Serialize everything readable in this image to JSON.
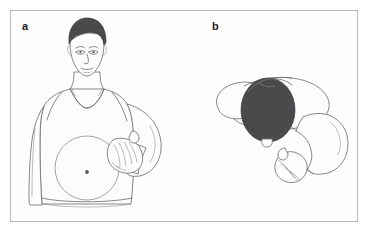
{
  "figure": {
    "kind": "medical-illustration",
    "border_color": "#b9b9bb",
    "background_color": "#ffffff",
    "line_color": "#6f7174",
    "hair_color": "#4a4a4c",
    "skin_fill": "#fdfdfd",
    "panels": [
      {
        "id": "a",
        "label": "a",
        "view": "front-standing",
        "description": "Person standing facing forward wearing a v-neck sleeveless top, with a circular stoma site marked on the abdomen and one hand held beside it",
        "elements": [
          "head-with-short-dark-hair",
          "face",
          "v-neck-sleeveless-shirt",
          "left-arm-hanging",
          "right-arm-bent",
          "cupped-hand",
          "abdomen-stoma-circle",
          "stoma-center-dot",
          "waistband"
        ]
      },
      {
        "id": "b",
        "label": "b",
        "view": "overhead-bent-forward",
        "description": "Overhead view of the same person bent forward, showing top of the dark-haired head, the shoulders and back, and one arm reaching downward with a cupped hand",
        "elements": [
          "head-top-dark-hair",
          "nose-tip",
          "shoulder-left",
          "back-torso",
          "arm-reaching-down",
          "cupped-hand"
        ]
      }
    ]
  }
}
